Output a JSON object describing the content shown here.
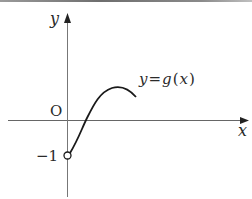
{
  "figure": {
    "axis_labels": {
      "x": "x",
      "y": "y"
    },
    "origin_label": "O",
    "y_intercept_label": "−1",
    "curve_label": "y = g(x)",
    "curve_label_parts": {
      "lhs": "y",
      "eq": "=",
      "fn": "g",
      "open": "(",
      "arg": "x",
      "close": ")"
    },
    "open_point": {
      "x": 0,
      "y": -1,
      "style": "open-circle"
    },
    "colors": {
      "axis": "#555555",
      "curve": "#1a1a1a",
      "text": "#2a2a2a"
    }
  }
}
